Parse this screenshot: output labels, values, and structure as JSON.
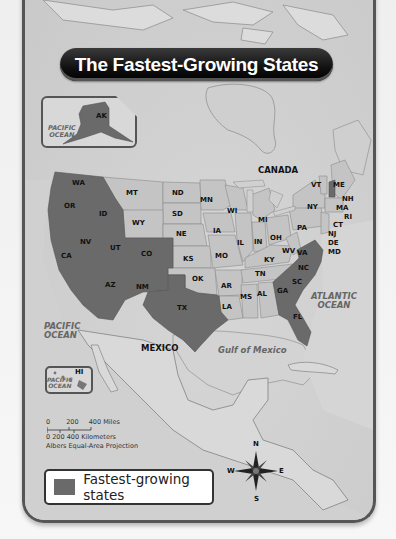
{
  "title": "The Fastest-Growing States",
  "colors": {
    "fastest_growing": "#6a6a6a",
    "other_states": "#c4c4c4",
    "land_background": "#d6d6d6",
    "banner": "#111111"
  },
  "states": {
    "WA": "WA",
    "OR": "OR",
    "ID": "ID",
    "NV": "NV",
    "CA": "CA",
    "UT": "UT",
    "CO": "CO",
    "AZ": "AZ",
    "NM": "NM",
    "TX": "TX",
    "MT": "MT",
    "WY": "WY",
    "ND": "ND",
    "SD": "SD",
    "NE": "NE",
    "KS": "KS",
    "OK": "OK",
    "MN": "MN",
    "IA": "IA",
    "MO": "MO",
    "AR": "AR",
    "LA": "LA",
    "WI": "WI",
    "IL": "IL",
    "MI": "MI",
    "IN": "IN",
    "KY": "KY",
    "TN": "TN",
    "MS": "MS",
    "AL": "AL",
    "OH": "OH",
    "WV": "WV",
    "PA": "PA",
    "NY": "NY",
    "VA": "VA",
    "NC": "NC",
    "SC": "SC",
    "GA": "GA",
    "FL": "FL",
    "VT": "VT",
    "ME": "ME",
    "NH": "NH",
    "MA": "MA",
    "RI": "RI",
    "CT": "CT",
    "NJ": "NJ",
    "DE": "DE",
    "MD": "MD",
    "AK": "AK",
    "HI": "HI"
  },
  "fastest_growing_states": [
    "WA",
    "OR",
    "ID",
    "NV",
    "CA",
    "UT",
    "CO",
    "AZ",
    "NM",
    "TX",
    "VA",
    "NC",
    "SC",
    "GA",
    "FL",
    "NH",
    "AK"
  ],
  "places": {
    "canada": "CANADA",
    "mexico": "MEXICO",
    "pacific_ocean": "PACIFIC OCEAN",
    "pacific_ocean_line1": "PACIFIC",
    "pacific_ocean_line2": "OCEAN",
    "atlantic_ocean_line1": "ATLANTIC",
    "atlantic_ocean_line2": "OCEAN",
    "gulf_of_mexico": "Gulf of Mexico"
  },
  "scale": {
    "miles": [
      "0",
      "200",
      "400 Miles"
    ],
    "kilometers": "0  200 400 Kilometers",
    "projection": "Albers Equal-Area Projection"
  },
  "compass": {
    "n": "N",
    "s": "S",
    "e": "E",
    "w": "W"
  },
  "legend": {
    "label": "Fastest-growing states"
  }
}
